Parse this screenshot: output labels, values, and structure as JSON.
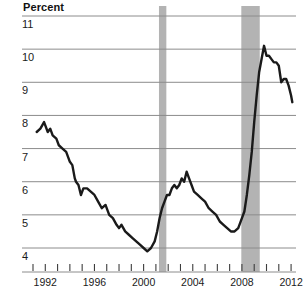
{
  "chart_data": {
    "type": "line",
    "title": "Percent",
    "xlabel": "",
    "ylabel": "Percent",
    "ylim": [
      4,
      11
    ],
    "xlim": [
      1991.0,
      2012.4
    ],
    "grid": true,
    "legend": null,
    "ytick_labels": [
      "11",
      "10",
      "9",
      "8",
      "7",
      "6",
      "5",
      "4"
    ],
    "yticks": [
      11,
      10,
      9,
      8,
      7,
      6,
      5,
      4
    ],
    "xtick_labels": [
      "1992",
      "1996",
      "2000",
      "2004",
      "2008",
      "2012"
    ],
    "xticks": [
      1992,
      1996,
      2000,
      2004,
      2008,
      2012
    ],
    "xtick_minor": [
      1991,
      1992,
      1993,
      1994,
      1995,
      1996,
      1997,
      1998,
      1999,
      2000,
      2001,
      2002,
      2003,
      2004,
      2005,
      2006,
      2007,
      2008,
      2009,
      2010,
      2011,
      2012
    ],
    "series": [
      {
        "name": "Unemployment rate",
        "color": "#1a1a1a",
        "x": [
          1991.3,
          1991.6,
          1991.9,
          1992.0,
          1992.2,
          1992.4,
          1992.6,
          1992.9,
          1993.1,
          1993.4,
          1993.7,
          1994.0,
          1994.2,
          1994.4,
          1994.5,
          1994.7,
          1994.9,
          1995.1,
          1995.4,
          1995.7,
          1996.0,
          1996.3,
          1996.6,
          1996.9,
          1997.2,
          1997.5,
          1997.8,
          1998.0,
          1998.2,
          1998.5,
          1998.8,
          1999.1,
          1999.4,
          1999.7,
          2000.0,
          2000.3,
          2000.6,
          2000.9,
          2001.1,
          2001.3,
          2001.5,
          2001.7,
          2001.9,
          2002.1,
          2002.3,
          2002.5,
          2002.7,
          2002.9,
          2003.1,
          2003.3,
          2003.5,
          2003.7,
          2003.9,
          2004.1,
          2004.4,
          2004.7,
          2005.0,
          2005.3,
          2005.6,
          2005.9,
          2006.2,
          2006.5,
          2006.8,
          2007.1,
          2007.4,
          2007.7,
          2008.0,
          2008.2,
          2008.4,
          2008.6,
          2008.8,
          2009.0,
          2009.2,
          2009.4,
          2009.6,
          2009.8,
          2010.0,
          2010.2,
          2010.4,
          2010.6,
          2010.8,
          2011.0,
          2011.2,
          2011.4,
          2011.6,
          2011.8,
          2012.0,
          2012.1
        ],
        "y": [
          7.5,
          7.6,
          7.8,
          7.7,
          7.5,
          7.6,
          7.4,
          7.3,
          7.1,
          7.0,
          6.9,
          6.6,
          6.5,
          6.1,
          6.0,
          5.9,
          5.6,
          5.8,
          5.8,
          5.7,
          5.6,
          5.4,
          5.2,
          5.3,
          5.0,
          4.9,
          4.7,
          4.6,
          4.7,
          4.5,
          4.4,
          4.3,
          4.2,
          4.1,
          4.0,
          3.9,
          4.0,
          4.2,
          4.5,
          4.9,
          5.2,
          5.4,
          5.6,
          5.6,
          5.8,
          5.9,
          5.8,
          5.9,
          6.1,
          6.0,
          6.3,
          6.1,
          5.9,
          5.7,
          5.6,
          5.5,
          5.4,
          5.2,
          5.1,
          5.0,
          4.8,
          4.7,
          4.6,
          4.5,
          4.5,
          4.6,
          4.9,
          5.1,
          5.6,
          6.2,
          6.9,
          7.8,
          8.6,
          9.3,
          9.7,
          10.1,
          9.8,
          9.8,
          9.7,
          9.6,
          9.6,
          9.5,
          9.0,
          9.1,
          9.1,
          8.9,
          8.6,
          8.4
        ],
        "linewidth": 2.4
      }
    ],
    "shaded_regions": [
      {
        "name": "recession-2001",
        "x0": 2001.25,
        "x1": 2001.85,
        "color": "#b3b3b3"
      },
      {
        "name": "recession-2008",
        "x0": 2007.95,
        "x1": 2009.45,
        "color": "#b3b3b3"
      }
    ],
    "axis_color": "#8c8c8c",
    "gridline_color": "#8c8c8c",
    "background": "#ffffff"
  }
}
